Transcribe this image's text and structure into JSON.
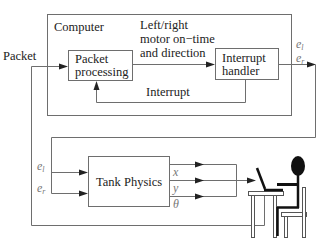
{
  "diagram": {
    "computer": {
      "label": "Computer",
      "packet_processing": [
        "Packet",
        "processing"
      ],
      "interrupt_handler": [
        "Interrupt",
        "handler"
      ],
      "command_label": [
        "Left/right",
        "motor on−time",
        "and direction"
      ],
      "interrupt_label": "Interrupt"
    },
    "input_label": "Packet",
    "outputs": {
      "el_base": "e",
      "el_sub": "l",
      "er_base": "e",
      "er_sub": "r"
    },
    "tank": {
      "label": "Tank Physics",
      "inputs": {
        "el_base": "e",
        "el_sub": "l",
        "er_base": "e",
        "er_sub": "r"
      },
      "outputs": [
        "x",
        "y",
        "θ"
      ]
    },
    "operator": {
      "icon": "person-at-laptop-icon"
    },
    "colors": {
      "line": "#6e6e6e",
      "text": "#222222",
      "math": "#777777",
      "figure": "#111111"
    }
  }
}
